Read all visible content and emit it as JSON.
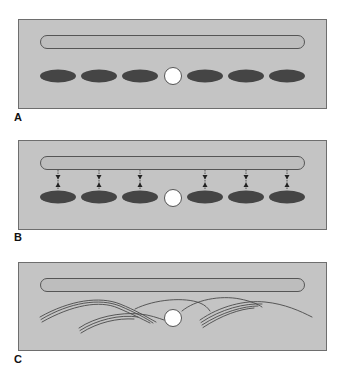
{
  "figure": {
    "colors": {
      "panel_fill": "#c4c4c4",
      "panel_border": "#6e6e6e",
      "capsule_fill": "#bdbdbd",
      "capsule_border": "#555555",
      "ellipse_fill": "#454545",
      "circle_fill": "#ffffff",
      "circle_border": "#555555",
      "arrow_color": "#222222",
      "curve_color": "#4a4a4a"
    },
    "panels": [
      {
        "label": "A",
        "description": "Elongated capsule above a row of six dark ellipses with a central white circle",
        "ellipse_count": 6,
        "has_arrows": false,
        "has_curves": false
      },
      {
        "label": "B",
        "description": "Same arrangement with bidirectional dashed arrows connecting capsule to each ellipse",
        "ellipse_count": 6,
        "arrow_count": 6,
        "has_arrows": true,
        "has_curves": false
      },
      {
        "label": "C",
        "description": "Capsule above overlapping bundles of curved lines arching around the central white circle",
        "ellipse_count": 0,
        "has_arrows": false,
        "has_curves": true
      }
    ]
  }
}
